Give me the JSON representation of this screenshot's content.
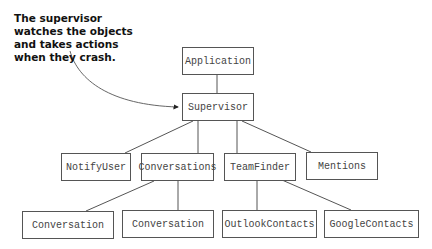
{
  "annotation": {
    "text": "The supervisor watches the objects and takes actions when they crash."
  },
  "nodes": {
    "application": {
      "label": "Application",
      "x": 182,
      "y": 47,
      "w": 72,
      "h": 28
    },
    "supervisor": {
      "label": "Supervisor",
      "x": 182,
      "y": 93,
      "w": 72,
      "h": 28
    },
    "notify_user": {
      "label": "NotifyUser",
      "x": 61,
      "y": 153,
      "w": 70,
      "h": 28
    },
    "conversations": {
      "label": "Conversations",
      "x": 141,
      "y": 153,
      "w": 73,
      "h": 28
    },
    "team_finder": {
      "label": "TeamFinder",
      "x": 224,
      "y": 153,
      "w": 72,
      "h": 28
    },
    "mentions": {
      "label": "Mentions",
      "x": 306,
      "y": 152,
      "w": 72,
      "h": 28
    },
    "conversation_1": {
      "label": "Conversation",
      "x": 22,
      "y": 211,
      "w": 92,
      "h": 28
    },
    "conversation_2": {
      "label": "Conversation",
      "x": 122,
      "y": 210,
      "w": 92,
      "h": 28
    },
    "outlook_contacts": {
      "label": "OutlookContacts",
      "x": 222,
      "y": 210,
      "w": 95,
      "h": 28
    },
    "google_contacts": {
      "label": "GoogleContacts",
      "x": 324,
      "y": 210,
      "w": 95,
      "h": 28
    }
  },
  "edges": [
    {
      "from": "application",
      "to": "supervisor"
    },
    {
      "from": "supervisor",
      "to": "notify_user"
    },
    {
      "from": "supervisor",
      "to": "conversations"
    },
    {
      "from": "supervisor",
      "to": "team_finder"
    },
    {
      "from": "supervisor",
      "to": "mentions"
    },
    {
      "from": "conversations",
      "to": "conversation_1"
    },
    {
      "from": "conversations",
      "to": "conversation_2"
    },
    {
      "from": "team_finder",
      "to": "outlook_contacts"
    },
    {
      "from": "team_finder",
      "to": "google_contacts"
    }
  ],
  "colors": {
    "line": "#555555",
    "box_border": "#555555",
    "text": "#444444",
    "annotation_text": "#111111"
  }
}
